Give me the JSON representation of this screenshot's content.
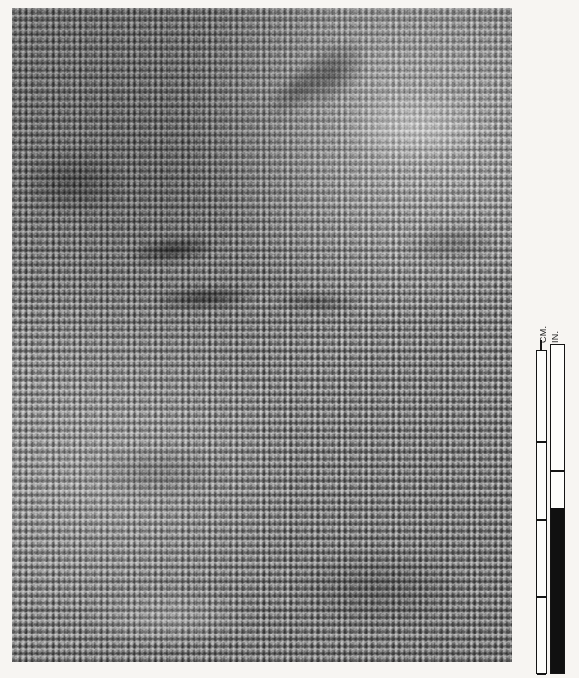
{
  "image": {
    "subject": "woven textile specimen",
    "weave_type": "plain weave",
    "medium": "black and white photograph",
    "background_color": "#f7f5f2",
    "plate": {
      "tone_light": "#c9c9c9",
      "tone_mid": "#909090",
      "tone_dark": "#3a3a3a"
    }
  },
  "scale": {
    "name": "photographic measurement scale",
    "cm_label": "CM.",
    "in_label": "IN.",
    "cm_column": {
      "unit": "centimeters",
      "tick_positions_px": [
        90,
        168,
        245,
        322
      ],
      "fill": "white"
    },
    "in_column": {
      "unit": "inches",
      "tick_positions_px": [
        125
      ],
      "black_fill_start_px": 163,
      "fill": "white and black"
    },
    "line_color": "#151515",
    "fill_color": "#fdfdfb"
  }
}
